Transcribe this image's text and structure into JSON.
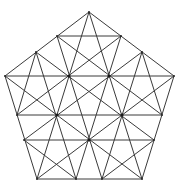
{
  "figure": {
    "stroke_color": "#3a3a3a",
    "node_color": "#1a1a1a",
    "background": "#ffffff"
  },
  "vertices": {
    "A": [
      89,
      12
    ],
    "B": [
      57,
      36
    ],
    "C": [
      121,
      36
    ],
    "D": [
      36,
      52
    ],
    "E": [
      142,
      52
    ],
    "F": [
      5,
      76
    ],
    "G": [
      69,
      76
    ],
    "H": [
      109,
      76
    ],
    "I": [
      174,
      76
    ],
    "J": [
      17,
      115
    ],
    "K": [
      57,
      115
    ],
    "L": [
      122,
      115
    ],
    "M": [
      162,
      115
    ],
    "N": [
      24,
      140
    ],
    "O": [
      89,
      140
    ],
    "P": [
      154,
      140
    ],
    "Q": [
      37,
      179
    ],
    "R": [
      76,
      179
    ],
    "S": [
      102,
      179
    ],
    "T": [
      142,
      179
    ]
  },
  "hubs": [
    "G",
    "H",
    "K",
    "L",
    "O"
  ],
  "segments": [
    [
      "A",
      "F"
    ],
    [
      "F",
      "Q"
    ],
    [
      "Q",
      "T"
    ],
    [
      "T",
      "I"
    ],
    [
      "I",
      "A"
    ],
    [
      "B",
      "C"
    ],
    [
      "F",
      "I"
    ],
    [
      "J",
      "M"
    ],
    [
      "N",
      "P"
    ],
    [
      "A",
      "Q"
    ],
    [
      "A",
      "T"
    ],
    [
      "B",
      "M"
    ],
    [
      "C",
      "J"
    ],
    [
      "D",
      "P"
    ],
    [
      "E",
      "N"
    ],
    [
      "F",
      "T"
    ],
    [
      "I",
      "Q"
    ],
    [
      "B",
      "S"
    ],
    [
      "C",
      "R"
    ],
    [
      "D",
      "R"
    ],
    [
      "E",
      "S"
    ],
    [
      "N",
      "R"
    ],
    [
      "P",
      "S"
    ],
    [
      "D",
      "J"
    ],
    [
      "E",
      "M"
    ]
  ]
}
